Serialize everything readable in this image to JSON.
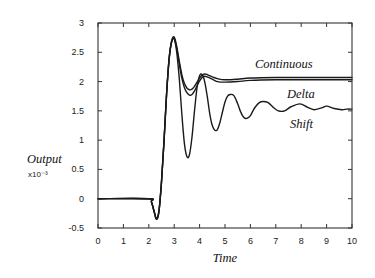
{
  "chart_data": {
    "type": "line",
    "title": "",
    "xlabel": "Time",
    "ylabel": "Output",
    "ylabel_scale": "x10⁻³",
    "xlim": [
      0,
      10
    ],
    "ylim": [
      -0.5,
      3
    ],
    "grid": false,
    "legend_position": "inline labels at right",
    "x_ticks": [
      0,
      1,
      2,
      3,
      4,
      5,
      6,
      7,
      8,
      9,
      10
    ],
    "x_tick_labels": [
      "0",
      "1",
      "2",
      "3",
      "4",
      "5",
      "6",
      "7",
      "8",
      "9",
      "10"
    ],
    "y_ticks": [
      -0.5,
      0,
      0.5,
      1,
      1.5,
      2,
      2.5,
      3
    ],
    "y_tick_labels": [
      "-0.5",
      "0",
      "0.5",
      "1",
      "1.5",
      "2",
      "2.5",
      "3"
    ],
    "series": [
      {
        "name": "Continuous",
        "x": [
          0,
          2.0,
          2.1,
          2.2,
          2.3,
          2.4,
          2.5,
          2.6,
          2.7,
          2.8,
          2.9,
          3.0,
          3.1,
          3.2,
          3.3,
          3.4,
          3.5,
          3.6,
          3.7,
          3.8,
          3.9,
          4.0,
          4.1,
          4.2,
          4.3,
          4.5,
          4.7,
          5.0,
          5.5,
          6.0,
          7.0,
          8.0,
          9.0,
          10.0
        ],
        "values": [
          0,
          0,
          -0.05,
          -0.2,
          -0.33,
          -0.2,
          0.3,
          1.0,
          1.8,
          2.4,
          2.7,
          2.76,
          2.6,
          2.35,
          2.12,
          1.97,
          1.89,
          1.86,
          1.87,
          1.92,
          1.99,
          2.06,
          2.11,
          2.13,
          2.12,
          2.08,
          2.05,
          2.03,
          2.04,
          2.06,
          2.07,
          2.07,
          2.07,
          2.07
        ]
      },
      {
        "name": "Delta",
        "x": [
          0,
          2.0,
          2.1,
          2.2,
          2.3,
          2.4,
          2.5,
          2.6,
          2.7,
          2.8,
          2.9,
          3.0,
          3.1,
          3.2,
          3.3,
          3.4,
          3.5,
          3.6,
          3.7,
          3.8,
          3.9,
          4.0,
          4.1,
          4.2,
          4.3,
          4.5,
          4.7,
          5.0,
          5.5,
          6.0,
          7.0,
          8.0,
          9.0,
          10.0
        ],
        "values": [
          0,
          0,
          -0.05,
          -0.2,
          -0.35,
          -0.22,
          0.28,
          0.98,
          1.78,
          2.38,
          2.68,
          2.73,
          2.56,
          2.3,
          2.06,
          1.9,
          1.81,
          1.77,
          1.78,
          1.84,
          1.93,
          2.01,
          2.07,
          2.09,
          2.08,
          2.04,
          2.0,
          1.99,
          2.0,
          2.02,
          2.03,
          2.03,
          2.03,
          2.03
        ]
      },
      {
        "name": "Shift",
        "x": [
          0,
          2.0,
          2.1,
          2.2,
          2.3,
          2.4,
          2.5,
          2.6,
          2.7,
          2.8,
          2.9,
          3.0,
          3.1,
          3.2,
          3.3,
          3.4,
          3.5,
          3.6,
          3.7,
          3.8,
          3.9,
          4.0,
          4.1,
          4.2,
          4.3,
          4.4,
          4.5,
          4.6,
          4.7,
          4.8,
          4.9,
          5.0,
          5.1,
          5.2,
          5.35,
          5.5,
          5.6,
          5.7,
          5.8,
          5.9,
          6.0,
          6.1,
          6.2,
          6.35,
          6.5,
          6.7,
          6.9,
          7.1,
          7.35,
          7.6,
          7.95,
          8.25,
          8.5,
          8.8,
          9.0,
          9.3,
          9.6,
          9.8,
          10.0
        ],
        "values": [
          0,
          0,
          -0.05,
          -0.2,
          -0.35,
          -0.22,
          0.28,
          0.98,
          1.78,
          2.38,
          2.68,
          2.73,
          2.5,
          2.05,
          1.45,
          0.95,
          0.72,
          0.75,
          1.05,
          1.5,
          1.9,
          2.1,
          2.12,
          2.0,
          1.75,
          1.45,
          1.25,
          1.17,
          1.18,
          1.3,
          1.48,
          1.65,
          1.75,
          1.78,
          1.76,
          1.62,
          1.5,
          1.41,
          1.37,
          1.38,
          1.42,
          1.5,
          1.57,
          1.64,
          1.66,
          1.64,
          1.56,
          1.5,
          1.5,
          1.57,
          1.62,
          1.56,
          1.52,
          1.55,
          1.58,
          1.54,
          1.52,
          1.53,
          1.53
        ]
      }
    ],
    "annotations": [
      {
        "text": "Continuous",
        "x": 7.3,
        "y": 2.28
      },
      {
        "text": "Delta",
        "x": 7.85,
        "y": 1.82
      },
      {
        "text": "Shift",
        "x": 7.6,
        "y": 1.33
      }
    ]
  },
  "axis_labels": {
    "ylabel": "Output",
    "ylabel_scale": "x10⁻³",
    "xlabel": "Time"
  },
  "series_labels": {
    "continuous": "Continuous",
    "delta": "Delta",
    "shift": "Shift"
  }
}
